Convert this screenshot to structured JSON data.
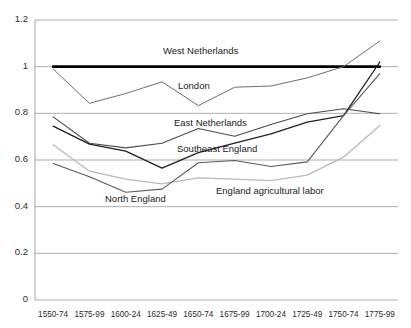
{
  "chart_data": {
    "type": "line",
    "title": "",
    "subtitle": "",
    "xlabel": "",
    "ylabel": "",
    "ylim": [
      0,
      1.2
    ],
    "yticks": [
      0,
      0.2,
      0.4,
      0.6,
      0.8,
      1,
      1.2
    ],
    "ytick_labels": [
      "0",
      "0.2",
      "0.4",
      "0.6",
      "0.8",
      "1",
      "1.2"
    ],
    "grid": "horizontal",
    "legend": "inline-annotations",
    "categories": [
      "1550-74",
      "1575-99",
      "1600-24",
      "1625-49",
      "1650-74",
      "1675-99",
      "1700-24",
      "1725-49",
      "1750-74",
      "1775-99"
    ],
    "series": [
      {
        "name": "West Netherlands",
        "color": "#000000",
        "width": 2.6,
        "values": [
          1.0,
          1.0,
          1.0,
          1.0,
          1.0,
          1.0,
          1.0,
          1.0,
          1.0,
          1.0
        ]
      },
      {
        "name": "London",
        "color": "#6e6e6e",
        "width": 1.0,
        "values": [
          0.99,
          0.843,
          0.885,
          0.935,
          0.833,
          0.912,
          0.917,
          0.952,
          1.0,
          1.11
        ]
      },
      {
        "name": "East Netherlands",
        "color": "#4a4a4a",
        "width": 1.1,
        "values": [
          0.785,
          0.672,
          0.652,
          0.672,
          0.735,
          0.702,
          0.752,
          0.798,
          0.82,
          0.798
        ]
      },
      {
        "name": "Southeast England",
        "color": "#1f1f1f",
        "width": 1.3,
        "values": [
          0.745,
          0.668,
          0.638,
          0.565,
          0.632,
          0.672,
          0.712,
          0.762,
          0.79,
          1.02
        ]
      },
      {
        "name": "England agricultural labor",
        "color": "#b9b9b9",
        "width": 1.3,
        "values": [
          0.665,
          0.552,
          0.518,
          0.498,
          0.523,
          0.518,
          0.512,
          0.535,
          0.612,
          0.748
        ]
      },
      {
        "name": "North England",
        "color": "#5a5a5a",
        "width": 1.1,
        "values": [
          0.585,
          0.528,
          0.462,
          0.475,
          0.588,
          0.598,
          0.572,
          0.592,
          0.79,
          0.97
        ]
      }
    ],
    "annotations": [
      {
        "text": "West Netherlands",
        "x_px": 163,
        "y_px": 45
      },
      {
        "text": "London",
        "x_px": 178,
        "y_px": 80
      },
      {
        "text": "East Netherlands",
        "x_px": 174,
        "y_px": 117
      },
      {
        "text": "Southeast England",
        "x_px": 177,
        "y_px": 143
      },
      {
        "text": "England agricultural labor",
        "x_px": 216,
        "y_px": 185
      },
      {
        "text": "North England",
        "x_px": 105,
        "y_px": 193
      }
    ],
    "plot_area": {
      "left": 35,
      "top": 20,
      "right": 398,
      "bottom": 300
    },
    "colors": {
      "axis": "#9a9a9a",
      "grid": "#9a9a9a",
      "text": "#2b2b2b",
      "background": "#ffffff"
    }
  }
}
